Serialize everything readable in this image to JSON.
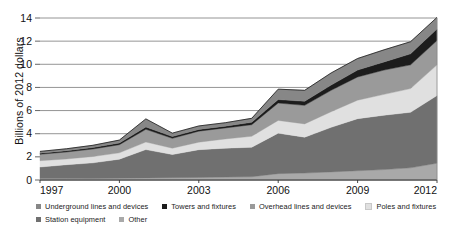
{
  "chart_data": {
    "type": "area",
    "stacked": true,
    "title": "",
    "subtitle": "",
    "xlabel": "",
    "ylabel": "Billions of 2012 dollars",
    "x": [
      1997,
      1998,
      1999,
      2000,
      2001,
      2002,
      2003,
      2004,
      2005,
      2006,
      2007,
      2008,
      2009,
      2010,
      2011,
      2012
    ],
    "xlim": [
      1997,
      2012
    ],
    "ylim": [
      0,
      14
    ],
    "xticks": [
      1997,
      2000,
      2003,
      2006,
      2009,
      2012
    ],
    "xtick_labels": [
      "1997",
      "2000",
      "2003",
      "2006",
      "2009",
      "2012"
    ],
    "yticks": [
      0,
      2,
      4,
      6,
      8,
      10,
      12,
      14
    ],
    "ytick_labels": [
      "0",
      "2",
      "4",
      "6",
      "8",
      "10",
      "12",
      "14"
    ],
    "grid": "horizontal",
    "legend_position": "bottom-left",
    "stack_order_bottom_to_top": [
      "Other",
      "Station equipment",
      "Poles and fixtures",
      "Overhead lines and devices",
      "Towers and fixtures",
      "Underground lines and devices"
    ],
    "series": [
      {
        "name": "Other",
        "color": "#a9a9a9",
        "values": [
          0.12,
          0.12,
          0.13,
          0.15,
          0.18,
          0.2,
          0.22,
          0.25,
          0.28,
          0.55,
          0.6,
          0.7,
          0.8,
          0.9,
          1.05,
          1.45
        ]
      },
      {
        "name": "Station equipment",
        "color": "#707070",
        "values": [
          1.0,
          1.2,
          1.35,
          1.65,
          2.45,
          2.0,
          2.4,
          2.5,
          2.55,
          3.5,
          3.1,
          3.85,
          4.5,
          4.7,
          4.8,
          5.85
        ]
      },
      {
        "name": "Poles and fixtures",
        "color": "#e0e0e0",
        "values": [
          0.55,
          0.5,
          0.55,
          0.55,
          0.65,
          0.55,
          0.65,
          0.8,
          0.95,
          1.1,
          1.15,
          1.35,
          1.6,
          1.8,
          2.05,
          2.65
        ]
      },
      {
        "name": "Overhead lines and devices",
        "color": "#9a9a9a",
        "values": [
          0.55,
          0.6,
          0.65,
          0.7,
          1.1,
          0.85,
          0.95,
          0.95,
          1.0,
          1.5,
          1.6,
          1.85,
          2.0,
          2.1,
          2.05,
          2.1
        ]
      },
      {
        "name": "Towers and fixtures",
        "color": "#1c1c1c",
        "values": [
          0.1,
          0.1,
          0.12,
          0.15,
          0.2,
          0.15,
          0.15,
          0.15,
          0.2,
          0.3,
          0.35,
          0.45,
          0.6,
          0.7,
          0.95,
          1.0
        ]
      },
      {
        "name": "Underground lines and devices",
        "color": "#878787",
        "values": [
          0.15,
          0.18,
          0.2,
          0.25,
          0.7,
          0.3,
          0.3,
          0.3,
          0.35,
          0.9,
          0.95,
          1.05,
          1.0,
          1.05,
          1.05,
          1.0
        ]
      }
    ],
    "totals": [
      2.47,
      2.7,
      3.0,
      3.45,
      5.28,
      4.05,
      4.67,
      4.95,
      5.33,
      7.85,
      7.75,
      9.25,
      10.5,
      11.25,
      11.95,
      14.05
    ]
  },
  "legend": {
    "items": [
      {
        "label": "Underground lines and devices",
        "color": "#878787",
        "row": 1
      },
      {
        "label": "Towers and fixtures",
        "color": "#1c1c1c",
        "row": 1
      },
      {
        "label": "Overhead lines and devices",
        "color": "#9a9a9a",
        "row": 1
      },
      {
        "label": "Poles and fixtures",
        "color": "#e0e0e0",
        "row": 1
      },
      {
        "label": "Station equipment",
        "color": "#707070",
        "row": 2
      },
      {
        "label": "Other",
        "color": "#a9a9a9",
        "row": 2
      }
    ]
  }
}
